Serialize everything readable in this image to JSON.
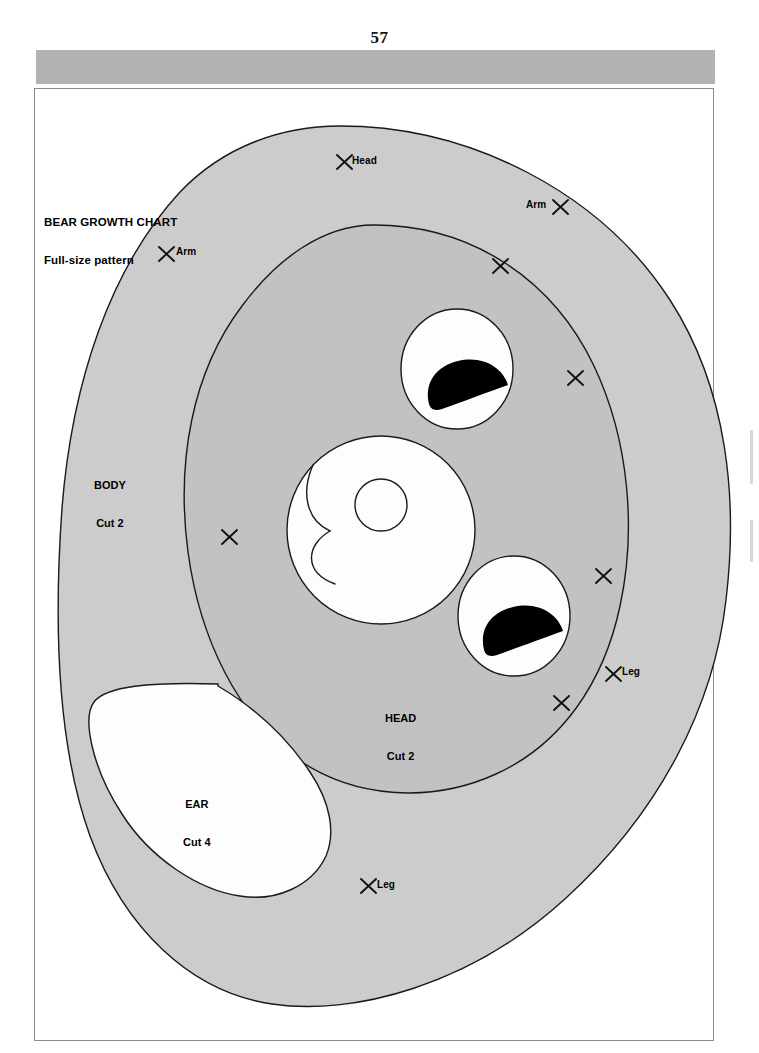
{
  "page": {
    "number": "57",
    "header_bar_color": "#b2b2b2",
    "background_color": "#ffffff"
  },
  "title_block": {
    "line1": "BEAR GROWTH CHART",
    "line2": "Full-size pattern"
  },
  "colors": {
    "body_fill": "#cccccc",
    "head_fill": "#c2c2c2",
    "piece_fill": "#fdfdfd",
    "pupil_fill": "#000000",
    "outline": "#1a1a1a"
  },
  "pattern_pieces": [
    {
      "id": "body",
      "name": "BODY",
      "cut": "Cut 2"
    },
    {
      "id": "head",
      "name": "HEAD",
      "cut": "Cut 2"
    },
    {
      "id": "ear",
      "name": "EAR",
      "cut": "Cut 4"
    }
  ],
  "piece_labels": {
    "body": {
      "name": "BODY",
      "cut": "Cut 2"
    },
    "head": {
      "name": "HEAD",
      "cut": "Cut 2"
    },
    "ear": {
      "name": "EAR",
      "cut": "Cut 4"
    }
  },
  "registration_marks": [
    {
      "id": "head-top",
      "label": "Head",
      "label_side": "right",
      "x": 344,
      "y": 162
    },
    {
      "id": "arm-right",
      "label": "Arm",
      "label_side": "left",
      "x": 560,
      "y": 207
    },
    {
      "id": "arm-left",
      "label": "Arm",
      "label_side": "right",
      "x": 166,
      "y": 254
    },
    {
      "id": "mark-a",
      "label": "",
      "label_side": "none",
      "x": 500,
      "y": 266
    },
    {
      "id": "mark-b",
      "label": "",
      "label_side": "none",
      "x": 575,
      "y": 378
    },
    {
      "id": "mark-c",
      "label": "",
      "label_side": "none",
      "x": 229,
      "y": 537
    },
    {
      "id": "mark-d",
      "label": "",
      "label_side": "none",
      "x": 603,
      "y": 576
    },
    {
      "id": "leg-right",
      "label": "Leg",
      "label_side": "right",
      "x": 613,
      "y": 674
    },
    {
      "id": "mark-e",
      "label": "",
      "label_side": "none",
      "x": 561,
      "y": 703
    },
    {
      "id": "leg-bottom",
      "label": "Leg",
      "label_side": "right",
      "x": 368,
      "y": 886
    }
  ],
  "mark_labels": {
    "head_top": "Head",
    "arm_right": "Arm",
    "arm_left": "Arm",
    "leg_right": "Leg",
    "leg_bottom": "Leg"
  }
}
